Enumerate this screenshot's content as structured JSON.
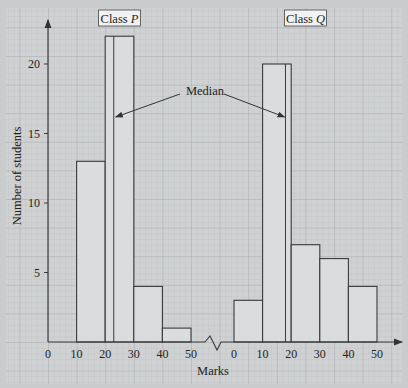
{
  "chart_data": {
    "type": "bar",
    "title": "",
    "xlabel": "Marks",
    "ylabel": "Number of students",
    "ylim": [
      0,
      23
    ],
    "yticks": [
      5,
      10,
      15,
      20
    ],
    "grid": true,
    "annotation": "Median",
    "series": [
      {
        "name": "Class P",
        "label_text": "Class ",
        "label_italic": "P",
        "bins": [
          [
            10,
            20
          ],
          [
            20,
            30
          ],
          [
            30,
            40
          ],
          [
            40,
            50
          ]
        ],
        "values": [
          13,
          22,
          4,
          1
        ],
        "median": 23,
        "xticks": [
          0,
          10,
          20,
          30,
          40,
          50
        ]
      },
      {
        "name": "Class Q",
        "label_text": "Class ",
        "label_italic": "Q",
        "bins": [
          [
            0,
            10
          ],
          [
            10,
            20
          ],
          [
            20,
            30
          ],
          [
            30,
            40
          ],
          [
            40,
            50
          ]
        ],
        "values": [
          3,
          20,
          7,
          6,
          4
        ],
        "median": 18,
        "xticks": [
          0,
          10,
          20,
          30,
          40,
          50
        ]
      }
    ]
  },
  "colors": {
    "background": "#c9cbcc",
    "paper": "#cfd1d2",
    "grid_minor": "#b9bcbe",
    "grid_major": "#a9acae",
    "bar_fill": "#dadcdd",
    "stroke": "#3a3a3a"
  }
}
